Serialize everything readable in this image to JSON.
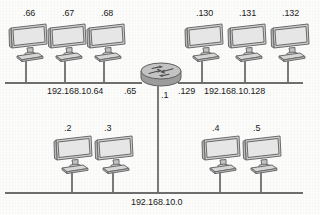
{
  "diagram": {
    "type": "network-topology",
    "router": {
      "name": "router",
      "icon": "router-icon",
      "interfaces": [
        {
          "id": "if-left",
          "label": ".65"
        },
        {
          "id": "if-right",
          "label": ".129"
        },
        {
          "id": "if-bottom",
          "label": ".1"
        }
      ]
    },
    "segments": [
      {
        "id": "segment-top-left",
        "network_label": "192.168.10.64",
        "position": "top-left",
        "hosts": [
          {
            "id": "host-66",
            "label": ".66",
            "icon": "computer-icon"
          },
          {
            "id": "host-67",
            "label": ".67",
            "icon": "computer-icon"
          },
          {
            "id": "host-68",
            "label": ".68",
            "icon": "computer-icon"
          }
        ]
      },
      {
        "id": "segment-top-right",
        "network_label": "192.168.10.128",
        "position": "top-right",
        "hosts": [
          {
            "id": "host-130",
            "label": ".130",
            "icon": "computer-icon"
          },
          {
            "id": "host-131",
            "label": ".131",
            "icon": "computer-icon"
          },
          {
            "id": "host-132",
            "label": ".132",
            "icon": "computer-icon"
          }
        ]
      },
      {
        "id": "segment-bottom",
        "network_label": "192.168.10.0",
        "position": "bottom",
        "hosts": [
          {
            "id": "host-2",
            "label": ".2",
            "icon": "computer-icon"
          },
          {
            "id": "host-3",
            "label": ".3",
            "icon": "computer-icon"
          },
          {
            "id": "host-4",
            "label": ".4",
            "icon": "computer-icon"
          },
          {
            "id": "host-5",
            "label": ".5",
            "icon": "computer-icon"
          }
        ]
      }
    ],
    "colors": {
      "line": "#6e6e6e",
      "text": "#1b1b1b",
      "device_fill": "#d5d5d5",
      "device_stroke": "#6a6a6a",
      "background": "#fcfcfb"
    }
  }
}
